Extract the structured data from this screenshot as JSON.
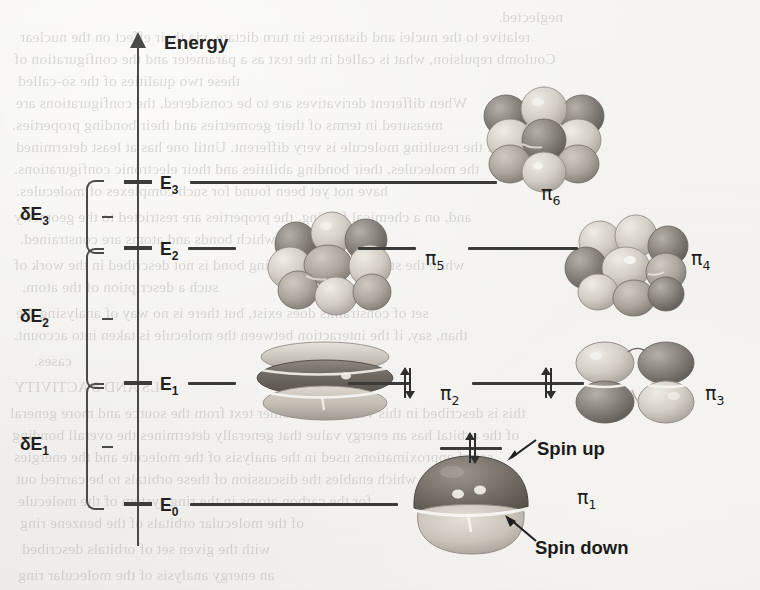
{
  "figure": {
    "axis_label": "Energy",
    "background_color": "#f2f1ee",
    "ink_color": "#3a3a38"
  },
  "axis": {
    "name": "energy-axis",
    "direction": "up",
    "ticks": [
      {
        "id": "E3",
        "label": "E",
        "sub": "3",
        "y": 182
      },
      {
        "id": "E2",
        "label": "E",
        "sub": "2",
        "y": 248
      },
      {
        "id": "E1",
        "label": "E",
        "sub": "1",
        "y": 383
      },
      {
        "id": "E0",
        "label": "E",
        "sub": "0",
        "y": 504
      }
    ]
  },
  "gaps": [
    {
      "id": "dE3",
      "label": "δE",
      "sub": "3",
      "from": "E2",
      "to": "E3",
      "top": 180,
      "bottom": 250
    },
    {
      "id": "dE2",
      "label": "δE",
      "sub": "2",
      "from": "E1",
      "to": "E2",
      "top": 248,
      "bottom": 385
    },
    {
      "id": "dE1",
      "label": "δE",
      "sub": "1",
      "from": "E0",
      "to": "E1",
      "top": 383,
      "bottom": 506
    }
  ],
  "orbitals": [
    {
      "id": "pi6",
      "label": "π",
      "sub": "6",
      "level": "E3",
      "electrons": 0,
      "label_x": 541,
      "label_y": 196
    },
    {
      "id": "pi5",
      "label": "π",
      "sub": "5",
      "level": "E2",
      "electrons": 0,
      "label_x": 425,
      "label_y": 261
    },
    {
      "id": "pi4",
      "label": "π",
      "sub": "4",
      "level": "E2",
      "electrons": 0,
      "label_x": 691,
      "label_y": 261
    },
    {
      "id": "pi2",
      "label": "π",
      "sub": "2",
      "level": "E1",
      "electrons": 2,
      "label_x": 440,
      "label_y": 396
    },
    {
      "id": "pi3",
      "label": "π",
      "sub": "3",
      "level": "E1",
      "electrons": 2,
      "label_x": 705,
      "label_y": 396
    },
    {
      "id": "pi1",
      "label": "π",
      "sub": "1",
      "level": "E0",
      "electrons": 2,
      "label_x": 577,
      "label_y": 500
    }
  ],
  "annotations": [
    {
      "id": "spin-up",
      "text": "Spin up",
      "x": 537,
      "y": 448
    },
    {
      "id": "spin-down",
      "text": "Spin down",
      "x": 535,
      "y": 547
    }
  ],
  "bleed_text": [
    {
      "text": "neglected.",
      "x": 498,
      "y": 8
    },
    {
      "text": "relative to the nuclei and distances in turn dictate, via their effect on the nuclear",
      "x": 20,
      "y": 28
    },
    {
      "text": "Coulomb repulsion, what is called in the text as a parameter and the configuration of",
      "x": 14,
      "y": 50
    },
    {
      "text": "these two qualities of the so-called",
      "x": 18,
      "y": 72
    },
    {
      "text": "When different derivatives are to be considered, the configurations are",
      "x": 16,
      "y": 94
    },
    {
      "text": "measured in terms of their geometries and their bonding properties.",
      "x": 12,
      "y": 116
    },
    {
      "text": "of the resulting molecule is very different. Until one has at least determined",
      "x": 16,
      "y": 138
    },
    {
      "text": "the molecules, their bonding abilities and their electronic configurations.",
      "x": 14,
      "y": 160
    },
    {
      "text": "have not yet been found for such complexes of molecules.",
      "x": 16,
      "y": 182
    },
    {
      "text": "and, on a chemical footing, the properties are restricted to the geometry",
      "x": 14,
      "y": 208
    },
    {
      "text": "in which bonds and atoms are constrained.",
      "x": 20,
      "y": 230
    },
    {
      "text": "while the strength of the resulting bond is not described in the work of",
      "x": 14,
      "y": 256
    },
    {
      "text": "such a description of the atom.",
      "x": 22,
      "y": 278
    },
    {
      "text": "set of constraints does exist, but there is no way of analysing the",
      "x": 16,
      "y": 304
    },
    {
      "text": "than, say, if the interaction between the molecule is taken into account.",
      "x": 14,
      "y": 326
    },
    {
      "text": "cases.",
      "x": 34,
      "y": 352
    },
    {
      "text": "LS AND 8 ACTIVITY",
      "x": 14,
      "y": 378
    },
    {
      "text": "this is described in this volume or another text from the source and more general",
      "x": 10,
      "y": 404
    },
    {
      "text": "of the orbital has an energy value that generally determines the overall bonding",
      "x": 12,
      "y": 426
    },
    {
      "text": "set of approximations used in the analysis of the molecule and the energies",
      "x": 14,
      "y": 448
    },
    {
      "text": "which enables the discussion of these orbitals to be carried out",
      "x": 16,
      "y": 470
    },
    {
      "text": "for the carbon atoms in the ring system of the molecule",
      "x": 18,
      "y": 492
    },
    {
      "text": "of the molecular orbitals of the benzene ring",
      "x": 20,
      "y": 514
    },
    {
      "text": "with the given set of orbitals described",
      "x": 22,
      "y": 540
    },
    {
      "text": "an energy analysis of the molecular ring",
      "x": 18,
      "y": 566
    }
  ]
}
